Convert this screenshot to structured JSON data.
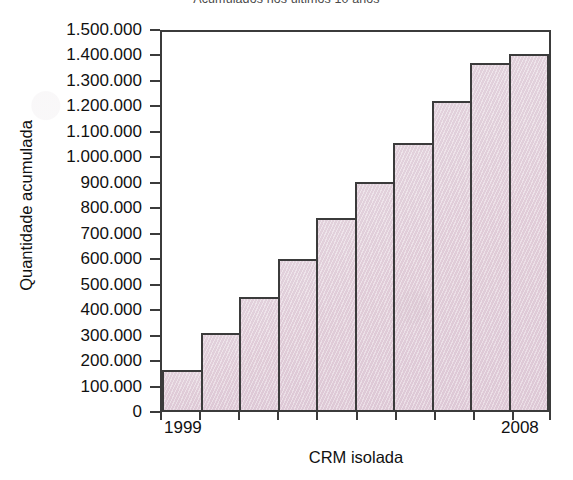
{
  "chart_data": {
    "type": "bar",
    "title": "Acumulados nos últimos 10 anos",
    "xlabel": "CRM isolada",
    "ylabel": "Quantidade acumulada",
    "categories": [
      "1999",
      "2000",
      "2001",
      "2002",
      "2003",
      "2004",
      "2005",
      "2006",
      "2007",
      "2008"
    ],
    "values": [
      157000,
      306000,
      450000,
      600000,
      760000,
      905000,
      1060000,
      1225000,
      1378000,
      1412000
    ],
    "ylim": [
      0,
      1500000
    ],
    "ytick_values": [
      0,
      100000,
      200000,
      300000,
      400000,
      500000,
      600000,
      700000,
      800000,
      900000,
      1000000,
      1100000,
      1200000,
      1300000,
      1400000,
      1500000
    ],
    "ytick_labels": [
      "1.500.000",
      "1.400.000",
      "1.300.000",
      "1.200.000",
      "1.100.000",
      "1.000.000",
      "900.000",
      "800.000",
      "700.000",
      "600.000",
      "500.000",
      "400.000",
      "300.000",
      "200.000",
      "100.000",
      "0"
    ],
    "xtick_labels_shown": [
      "1999",
      "2008"
    ],
    "grid": false,
    "legend": false,
    "legend_position": "none",
    "bar_fill_color": "#e4d3dd",
    "bar_border_color": "#3b3b3b",
    "axis_color": "#3b3b3b",
    "background_color": "#ffffff"
  }
}
